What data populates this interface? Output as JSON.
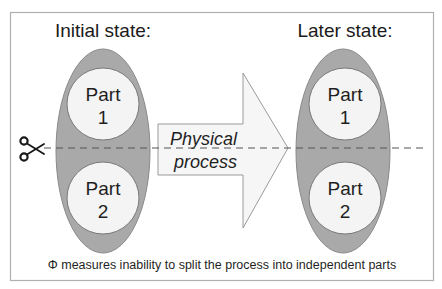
{
  "diagram": {
    "colors": {
      "background": "#ffffff",
      "frame_stroke": "#b0b0b0",
      "system_fill": "#a9a9a9",
      "system_stroke": "#8a8a8a",
      "part_fill": "#f4f4f4",
      "part_stroke": "#7a7a7a",
      "arrow_fill": "#f6f6f6",
      "arrow_stroke": "#9a9a9a",
      "cut_line": "#555555",
      "text": "#1a1a1a"
    },
    "initial_state": {
      "title": "Initial state:",
      "parts": [
        {
          "line1": "Part",
          "line2": "1"
        },
        {
          "line1": "Part",
          "line2": "2"
        }
      ]
    },
    "later_state": {
      "title": "Later state:",
      "parts": [
        {
          "line1": "Part",
          "line2": "1"
        },
        {
          "line1": "Part",
          "line2": "2"
        }
      ]
    },
    "process_arrow": {
      "line1": "Physical",
      "line2": "process"
    },
    "cut_icon": "scissors-icon",
    "cut_glyph": "✂",
    "caption": "Φ measures inability to split the process into independent parts"
  }
}
